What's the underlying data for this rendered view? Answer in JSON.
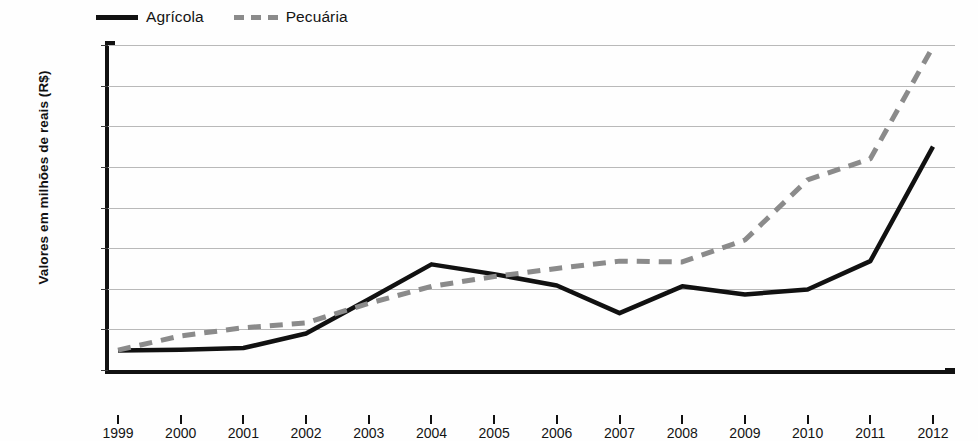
{
  "legend": {
    "position": "top-left",
    "entries": [
      {
        "label": "Agrícola",
        "style": "solid",
        "color": "#111111"
      },
      {
        "label": "Pecuária",
        "style": "dashed",
        "color": "#8b8b8b"
      }
    ]
  },
  "axes": {
    "ylabel": "Valores  em milhões de reais (R$)",
    "xlabel": ""
  },
  "chart_data": {
    "type": "line",
    "title": "",
    "subtitle": "",
    "xlabel": "",
    "ylabel": "Valores  em milhões de reais (R$)",
    "categories": [
      "1999",
      "2000",
      "2001",
      "2002",
      "2003",
      "2004",
      "2005",
      "2006",
      "2007",
      "2008",
      "2009",
      "2010",
      "2011",
      "2012"
    ],
    "x": [
      1999,
      2000,
      2001,
      2002,
      2003,
      2004,
      2005,
      2006,
      2007,
      2008,
      2009,
      2010,
      2011,
      2012
    ],
    "ylim": [
      0,
      4000
    ],
    "ytick_values": [
      0,
      500,
      1000,
      1500,
      2000,
      2500,
      3000,
      3500,
      4000
    ],
    "ytick_labels": [
      "0",
      "500",
      "1.000",
      "1.500",
      "2.000",
      "2.500",
      "3.000",
      "3.500",
      "4.000"
    ],
    "grid": true,
    "legend_position": "top-left",
    "series": [
      {
        "name": "Agrícola",
        "style": "solid",
        "color": "#111111",
        "values": [
          240,
          250,
          270,
          450,
          870,
          1300,
          1180,
          1040,
          700,
          1030,
          930,
          990,
          1340,
          2750
        ]
      },
      {
        "name": "Pecuária",
        "style": "dashed",
        "color": "#8b8b8b",
        "values": [
          245,
          420,
          520,
          580,
          820,
          1030,
          1150,
          1250,
          1340,
          1330,
          1600,
          2340,
          2600,
          3980
        ]
      }
    ]
  }
}
